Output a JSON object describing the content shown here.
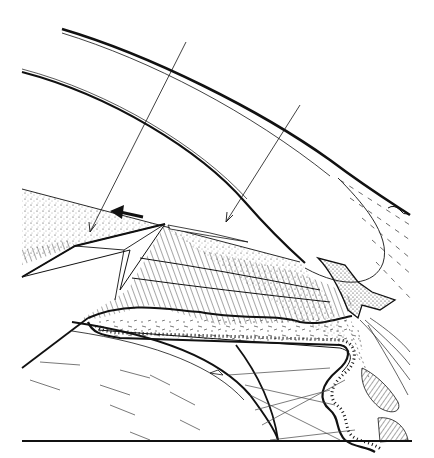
{
  "figure": {
    "type": "anatomical-line-illustration",
    "background": "#ffffff",
    "ink": "#111111",
    "labels": [],
    "annotations": {
      "pointer_lines": 2,
      "direction_arrow": "left-pointing bold arrow in stippled layer"
    },
    "structures": [
      "cornea-outer-surface",
      "cornea-inner-surface",
      "stippled-anterior-layer",
      "iris-stroma-hatched",
      "pigment-epithelium-beaded",
      "lens",
      "zonular-fibers",
      "ciliary-processes",
      "trabecular-meshwork",
      "sclera-fibers",
      "baseline"
    ]
  }
}
